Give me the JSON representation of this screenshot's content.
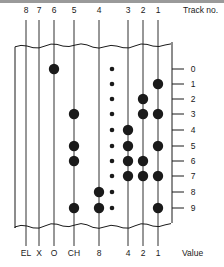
{
  "diagram": {
    "track_header_label": "Track no.",
    "value_footer_label": "Value",
    "row_label_axis": "character code (0-9)",
    "tracks": [
      {
        "no": "8",
        "value": "EL",
        "x": 26
      },
      {
        "no": "7",
        "value": "X",
        "x": 39
      },
      {
        "no": "6",
        "value": "O",
        "x": 54
      },
      {
        "no": "5",
        "value": "CH",
        "x": 74
      },
      {
        "no": "4",
        "value": "8",
        "x": 99
      },
      {
        "no": "3",
        "value": "4",
        "x": 128
      },
      {
        "no": "2",
        "value": "2",
        "x": 143
      },
      {
        "no": "1",
        "value": "1",
        "x": 158
      }
    ],
    "sprocket_x": 112,
    "rows": [
      {
        "label": "0",
        "y": 69,
        "holes": [
          "6"
        ]
      },
      {
        "label": "1",
        "y": 84,
        "holes": [
          "1"
        ]
      },
      {
        "label": "2",
        "y": 99,
        "holes": [
          "2"
        ]
      },
      {
        "label": "3",
        "y": 114,
        "holes": [
          "5",
          "2",
          "1"
        ]
      },
      {
        "label": "4",
        "y": 130,
        "holes": [
          "3"
        ]
      },
      {
        "label": "5",
        "y": 146,
        "holes": [
          "5",
          "3",
          "1"
        ]
      },
      {
        "label": "6",
        "y": 161,
        "holes": [
          "5",
          "3",
          "2"
        ]
      },
      {
        "label": "7",
        "y": 176,
        "holes": [
          "3",
          "2",
          "1"
        ]
      },
      {
        "label": "8",
        "y": 192,
        "holes": [
          "4"
        ]
      },
      {
        "label": "9",
        "y": 208,
        "holes": [
          "5",
          "4",
          "1"
        ]
      }
    ],
    "colors": {
      "ink": "#1a1a1a",
      "background": "#ffffff",
      "top_rule": "#9a9a9a"
    }
  }
}
